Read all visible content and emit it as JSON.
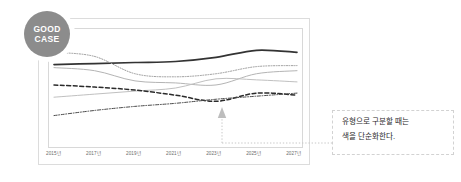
{
  "badge": {
    "line1": "GOOD",
    "line2": "CASE",
    "fill": "#8c8c8c",
    "text_color": "#ffffff"
  },
  "callout": {
    "line1": "유형으로 구분할 때는",
    "line2": "색을 단순화한다.",
    "border_color": "#d2d2d2"
  },
  "annotation": {
    "arrow": "up-arrow",
    "target_label": "dashed-series-dip"
  },
  "chart_data": {
    "type": "line",
    "title": "",
    "xlabel": "",
    "ylabel": "",
    "grid": false,
    "legend": "none",
    "note": "Monochrome chart — series distinguished by line style, not color",
    "categories": [
      "2015년",
      "2017년",
      "2019년",
      "2021년",
      "2023년",
      "2025년",
      "2027년"
    ],
    "x": [
      2015,
      2017,
      2019,
      2021,
      2023,
      2025,
      2027
    ],
    "xlim": [
      2015,
      2027
    ],
    "ylim": [
      0,
      100
    ],
    "series": [
      {
        "name": "주요 지표",
        "style": "solid-thick",
        "color": "#333333",
        "width": 1.7,
        "values": [
          72,
          73,
          74,
          75,
          79,
          86,
          84
        ]
      },
      {
        "name": "보조 지표 A",
        "style": "dotted",
        "color": "#9a9a9a",
        "width": 1.0,
        "values": [
          84,
          80,
          63,
          60,
          63,
          70,
          71
        ]
      },
      {
        "name": "보조 지표 B",
        "style": "solid-thin",
        "color": "#b4b4b4",
        "width": 1.0,
        "values": [
          69,
          66,
          56,
          54,
          52,
          63,
          66
        ]
      },
      {
        "name": "보조 지표 C",
        "style": "solid-thin",
        "color": "#c0c0c0",
        "width": 1.0,
        "values": [
          40,
          43,
          46,
          49,
          58,
          57,
          55
        ]
      },
      {
        "name": "대비 지표",
        "style": "dashed",
        "color": "#2b2b2b",
        "width": 1.5,
        "values": [
          52,
          50,
          47,
          42,
          36,
          44,
          42
        ]
      },
      {
        "name": "하위 지표",
        "style": "dash-dot",
        "color": "#4a4a4a",
        "width": 1.0,
        "values": [
          22,
          27,
          31,
          34,
          38,
          41,
          44
        ]
      }
    ]
  }
}
